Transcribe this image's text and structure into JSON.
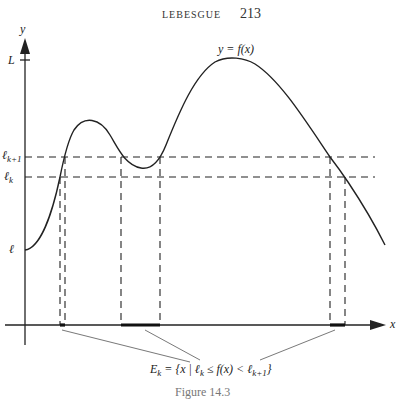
{
  "header": {
    "running_head": "LEBESGUE",
    "page_number": "213"
  },
  "figure": {
    "axis_labels": {
      "y": "y",
      "x": "x"
    },
    "curve_label": "y = f(x)",
    "levels": {
      "L": "L",
      "l_k1_base": "ℓ",
      "l_k1_sub": "k+1",
      "l_k_base": "ℓ",
      "l_k_sub": "k",
      "l": "ℓ"
    },
    "set_label": {
      "E": "E",
      "E_sub": "k",
      "body_1": " = {x | ℓ",
      "body_sub1": "k",
      "body_2": " ≤ f(x) < ℓ",
      "body_sub2": "k+1",
      "body_3": "}"
    },
    "caption": "Figure 14.3"
  }
}
